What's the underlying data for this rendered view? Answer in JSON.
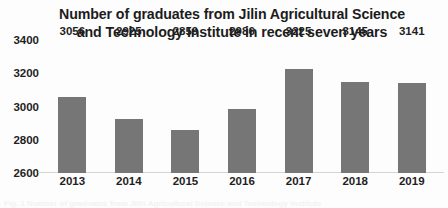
{
  "chart_data": {
    "type": "bar",
    "title": "Number of graduates from Jilin Agricultural Science and Technology Institute in recent seven years",
    "xlabel": "",
    "ylabel": "",
    "categories": [
      "2013",
      "2014",
      "2015",
      "2016",
      "2017",
      "2018",
      "2019"
    ],
    "values": [
      3056,
      2925,
      2859,
      2986,
      3225,
      3145,
      3141
    ],
    "series": [
      {
        "name": "Number of graduates",
        "values": [
          3056,
          2925,
          2859,
          2986,
          3225,
          3145,
          3141
        ]
      }
    ],
    "data_labels": [
      "3056",
      "2925",
      "2859",
      "2986",
      "3225",
      "3145",
      "3141"
    ],
    "ylim": [
      2600,
      3400
    ],
    "y_ticks": [
      "2600",
      "2800",
      "3000",
      "3200",
      "3400"
    ],
    "y_tick_values": [
      2600,
      2800,
      3000,
      3200,
      3400
    ],
    "grid": false,
    "legend": false,
    "bar_color": "#767676",
    "axis_color": "#d4d4d4",
    "text_color": "#1f1f1f"
  },
  "caption": {
    "text": "Fig. 1 Number of graduates from Jilin Agricultural Science and Technology Institute"
  }
}
